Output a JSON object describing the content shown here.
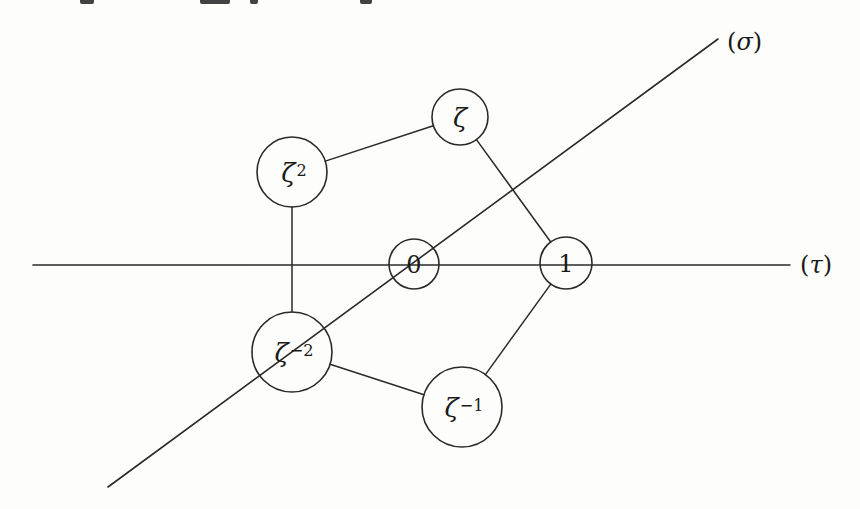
{
  "diagram": {
    "type": "graph",
    "stroke_color": "#2a2a2a",
    "background": "#fdfdfc",
    "axes": [
      {
        "id": "tau",
        "label_symbol": "τ",
        "label": "(τ)",
        "x1": 33,
        "y1": 265,
        "x2": 790,
        "y2": 265,
        "label_x": 800,
        "label_y": 265
      },
      {
        "id": "sigma",
        "label_symbol": "σ",
        "label": "(σ)",
        "x1": 108,
        "y1": 487,
        "x2": 718,
        "y2": 39,
        "label_x": 727,
        "label_y": 42
      }
    ],
    "nodes": [
      {
        "id": "zeta",
        "base": "ζ",
        "exp": "",
        "label": "ζ",
        "cx": 460,
        "cy": 117,
        "r": 28,
        "font_size": 26
      },
      {
        "id": "zeta2",
        "base": "ζ",
        "exp": "2",
        "label": "ζ²",
        "cx": 292,
        "cy": 172,
        "r": 35,
        "font_size": 26
      },
      {
        "id": "zero",
        "base": "0",
        "exp": "",
        "label": "0",
        "cx": 414,
        "cy": 264,
        "r": 25,
        "font_size": 24
      },
      {
        "id": "one",
        "base": "1",
        "exp": "",
        "label": "1",
        "cx": 566,
        "cy": 263,
        "r": 26,
        "font_size": 24
      },
      {
        "id": "zetam2",
        "base": "ζ",
        "exp": "−2",
        "label": "ζ⁻²",
        "cx": 292,
        "cy": 352,
        "r": 40,
        "font_size": 26
      },
      {
        "id": "zetam1",
        "base": "ζ",
        "exp": "−1",
        "label": "ζ⁻¹",
        "cx": 462,
        "cy": 407,
        "r": 40,
        "font_size": 26
      }
    ],
    "edges": [
      {
        "from": "zeta2",
        "to": "zeta"
      },
      {
        "from": "zeta",
        "to": "one"
      },
      {
        "from": "zeta2",
        "to": "zetam2"
      },
      {
        "from": "zetam2",
        "to": "zetam1"
      },
      {
        "from": "zetam1",
        "to": "one"
      }
    ]
  }
}
